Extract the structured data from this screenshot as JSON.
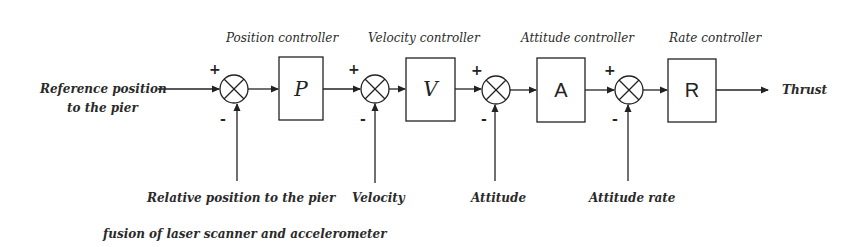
{
  "diagram": {
    "input": {
      "line1": "Reference position",
      "line2": "to the pier"
    },
    "output": "Thrust",
    "blocks": [
      {
        "id": "P",
        "symbol": "P",
        "title": "Position controller"
      },
      {
        "id": "V",
        "symbol": "V",
        "title": "Velocity controller"
      },
      {
        "id": "A",
        "symbol": "A",
        "title": "Attitude controller"
      },
      {
        "id": "R",
        "symbol": "R",
        "title": "Rate controller"
      }
    ],
    "junctions": [
      {
        "plus": "+",
        "minus": "-",
        "feedback": "Relative position to the pier"
      },
      {
        "plus": "+",
        "minus": "-",
        "feedback": "Velocity"
      },
      {
        "plus": "+",
        "minus": "-",
        "feedback": "Attitude"
      },
      {
        "plus": "+",
        "minus": "-",
        "feedback": "Attitude rate"
      }
    ],
    "note": "fusion of laser scanner and accelerometer",
    "colors": {
      "stroke": "#222222",
      "text": "#2a2a2a",
      "background": "#ffffff"
    }
  }
}
